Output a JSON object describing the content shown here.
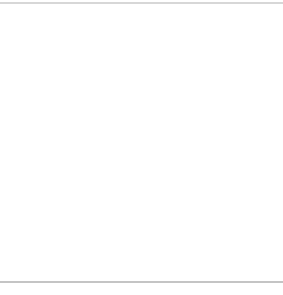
{
  "diagram": {
    "colors": {
      "line": "#555555",
      "text": "#2a2a2a",
      "border": "#b0b0b0",
      "background": "#ffffff"
    },
    "top_axis": {
      "variable": "x",
      "ticks": [
        {
          "label": "μ − 3σ",
          "k": -3,
          "row": 2
        },
        {
          "label": "μ − 2σ",
          "k": -2,
          "row": 1
        },
        {
          "label": "μ − σ",
          "k": -1,
          "row": 2
        },
        {
          "label": "μ",
          "k": 0,
          "row": 0
        },
        {
          "label": "μ + σ",
          "k": 1,
          "row": 2
        },
        {
          "label": "μ + 2σ",
          "k": 2,
          "row": 1
        },
        {
          "label": "μ + 3σ",
          "k": 3,
          "row": 2
        }
      ]
    },
    "bottom_axis": {
      "variable": "z",
      "ticks": [
        {
          "label": "−3",
          "k": -3
        },
        {
          "label": "−2",
          "k": -2
        },
        {
          "label": "−1",
          "k": -1
        },
        {
          "label": "0",
          "k": 0
        },
        {
          "label": "1",
          "k": 1
        },
        {
          "label": "2",
          "k": 2
        },
        {
          "label": "3",
          "k": 3
        }
      ]
    }
  }
}
